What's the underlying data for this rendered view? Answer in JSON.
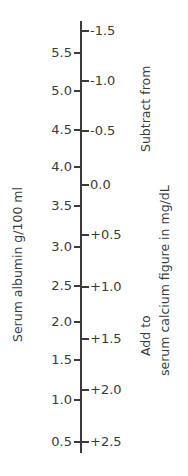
{
  "left_axis": {
    "title": "Serum albumin g/100 ml",
    "ticks": [
      {
        "label": "5.5",
        "y": 52
      },
      {
        "label": "5.0",
        "y": 90
      },
      {
        "label": "4.5",
        "y": 129
      },
      {
        "label": "4.0",
        "y": 166
      },
      {
        "label": "3.5",
        "y": 205
      },
      {
        "label": "3.0",
        "y": 246
      },
      {
        "label": "2.5",
        "y": 285
      },
      {
        "label": "2.0",
        "y": 321
      },
      {
        "label": "1.5",
        "y": 359
      },
      {
        "label": "1.0",
        "y": 399
      },
      {
        "label": "0.5",
        "y": 441
      }
    ]
  },
  "right_axis": {
    "subtract_label": "Subtract from",
    "add_label": "Add to",
    "units_label": "serum calcium figure in mg/dL",
    "ticks": [
      {
        "label": "-1.5",
        "y": 30
      },
      {
        "label": "-1.0",
        "y": 80
      },
      {
        "label": "-0.5",
        "y": 130
      },
      {
        "label": "0.0",
        "y": 184
      },
      {
        "label": "+0.5",
        "y": 234
      },
      {
        "label": "+1.0",
        "y": 286
      },
      {
        "label": "+1.5",
        "y": 338
      },
      {
        "label": "+2.0",
        "y": 389
      },
      {
        "label": "+2.5",
        "y": 441
      }
    ]
  }
}
